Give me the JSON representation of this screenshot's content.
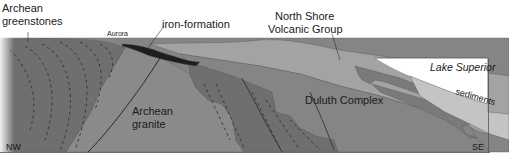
{
  "labels": {
    "archean_greenstones_line1": "Archean",
    "archean_greenstones_line2": "greenstones",
    "aurora": "Aurora",
    "iron_formation": "iron-formation",
    "north_shore_line1": "North Shore",
    "north_shore_line2": "Volcanic Group",
    "lake_superior": "Lake Superior",
    "sediments": "sediments",
    "duluth_complex": "Duluth Complex",
    "archean_granite_line1": "Archean",
    "archean_granite_line2": "granite",
    "nw": "NW",
    "se": "SE"
  },
  "colors": {
    "greenstones": "#6f6f6f",
    "granite": "#8a8a8a",
    "iron_formation": "#1e1e1e",
    "volcanic": "#a3a3a3",
    "duluth": "#858585",
    "lake": "#ffffff",
    "sediments": "#c4c4c4",
    "sill": "#7a7a7a"
  }
}
